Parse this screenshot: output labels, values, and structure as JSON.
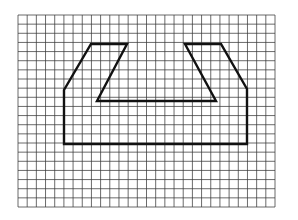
{
  "diagram": {
    "grid": {
      "x0": 18,
      "y0": 15,
      "x1": 275,
      "y1": 207,
      "cols": 28,
      "rows": 21,
      "line_color": "#3a3a3a",
      "line_width": 1
    },
    "shape": {
      "stroke": "#111111",
      "stroke_width": 2.4,
      "points": [
        [
          64,
          144
        ],
        [
          64,
          90
        ],
        [
          91,
          44
        ],
        [
          127,
          44
        ],
        [
          97,
          101
        ],
        [
          216,
          101
        ],
        [
          185,
          44
        ],
        [
          221,
          44
        ],
        [
          247,
          89
        ],
        [
          247,
          144
        ]
      ]
    },
    "background": "#ffffff"
  }
}
